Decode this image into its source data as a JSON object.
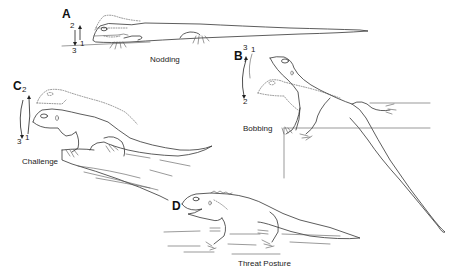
{
  "figure": {
    "type": "scientific line illustration",
    "panels": [
      {
        "id": "A",
        "letter": "A",
        "caption": "Nodding",
        "motion_numbers": [
          "2",
          "1",
          "3"
        ]
      },
      {
        "id": "B",
        "letter": "B",
        "caption": "Bobbing",
        "motion_numbers": [
          "3",
          "1",
          "2"
        ]
      },
      {
        "id": "C",
        "letter": "C",
        "caption": "Challenge",
        "motion_numbers": [
          "2",
          "3",
          "1"
        ]
      },
      {
        "id": "D",
        "letter": "D",
        "caption": "Threat Posture",
        "motion_numbers": []
      }
    ],
    "colors": {
      "background": "#ffffff",
      "ink": "#333333"
    }
  }
}
